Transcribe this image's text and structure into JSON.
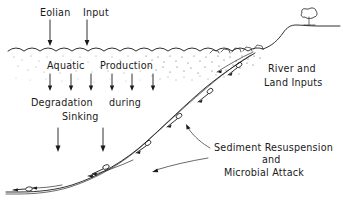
{
  "figure": {
    "background_color": "#ffffff",
    "ink_color": "#1a1a1a",
    "width": 343,
    "height": 204
  },
  "labels": {
    "eolian": "Eolian",
    "input": "Input",
    "aquatic": "Aquatic",
    "production": "Production",
    "degradation": "Degradation",
    "during": "during",
    "sinking": "Sinking",
    "river_and": "River and",
    "land_inputs": "Land Inputs",
    "sediment_resuspension": "Sediment Resuspension",
    "and": "and",
    "microbial_attack": "Microbial Attack"
  },
  "icons": {
    "tree": "tree-icon",
    "water_surface": "wavy-water-surface-icon",
    "sediment_particle": "sediment-particle-icon",
    "down_arrow": "down-arrow-icon",
    "leader_line": "leader-line-icon"
  },
  "annotations": {
    "eolian_arrow_count": 2,
    "production_arrow_count": 6,
    "sinking_arrow_count": 2,
    "resuspension_leader_count": 2,
    "particle_count": 8
  }
}
